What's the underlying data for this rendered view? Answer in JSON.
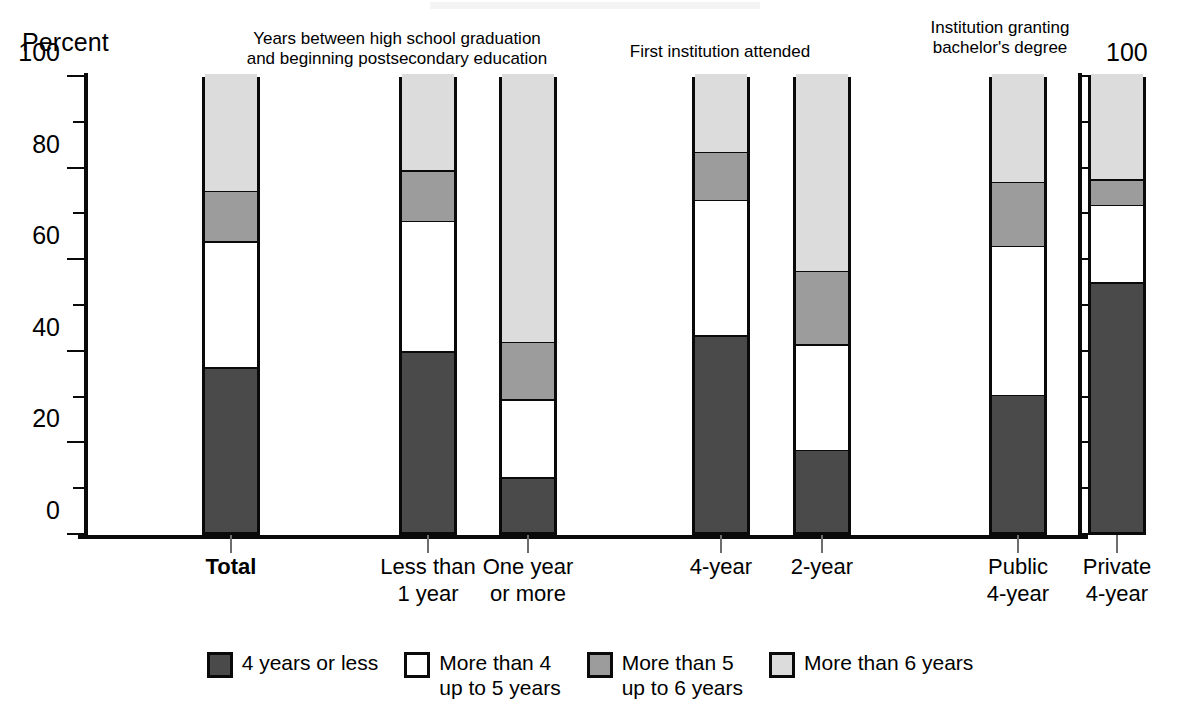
{
  "axis": {
    "title": "Percent",
    "left_ticks": [
      "0",
      "20",
      "40",
      "60",
      "80",
      "100"
    ],
    "right_ticks": [
      "0",
      "20",
      "40",
      "60",
      "80",
      "100"
    ]
  },
  "group_headers": [
    {
      "text": "Years between high school graduation\nand beginning postsecondary education"
    },
    {
      "text": "First institution attended"
    },
    {
      "text": "Institution granting\nbachelor's degree"
    }
  ],
  "categories": [
    "Total",
    "Less than\n1 year",
    "One year\nor more",
    "4-year",
    "2-year",
    "Public\n4-year",
    "Private\n4-year"
  ],
  "legend": [
    {
      "label": "4 years or less",
      "color": "#4a4a4a"
    },
    {
      "label": "More than 4\nup to 5 years",
      "color": "#ffffff"
    },
    {
      "label": "More than 5\nup to 6 years",
      "color": "#9c9c9c"
    },
    {
      "label": "More than 6 years",
      "color": "#dcdcdc"
    }
  ],
  "chart_data": {
    "type": "bar",
    "subtype": "stacked-100-percent",
    "title": "",
    "xlabel": "",
    "ylabel": "Percent",
    "ylim": [
      0,
      100
    ],
    "ytick_major_step": 20,
    "ytick_minor_step": 10,
    "grid": false,
    "legend_position": "bottom",
    "dual_y_axis": true,
    "categories": [
      "Total",
      "Less than 1 year",
      "One year or more",
      "4-year",
      "2-year",
      "Public 4-year",
      "Private 4-year"
    ],
    "series": [
      {
        "name": "4 years or less",
        "color": "#4a4a4a",
        "values": [
          36.0,
          39.5,
          12.0,
          43.0,
          18.0,
          30.0,
          54.5
        ]
      },
      {
        "name": "More than 4 up to 5 years",
        "color": "#ffffff",
        "values": [
          27.5,
          28.5,
          17.0,
          29.5,
          23.0,
          32.5,
          17.0
        ]
      },
      {
        "name": "More than 5 up to 6 years",
        "color": "#9c9c9c",
        "values": [
          11.0,
          11.0,
          12.5,
          10.5,
          16.0,
          14.0,
          5.5
        ]
      },
      {
        "name": "More than 6 years",
        "color": "#dcdcdc",
        "values": [
          25.5,
          21.0,
          58.5,
          17.0,
          43.0,
          23.5,
          23.0
        ]
      }
    ],
    "cumulative_tops": [
      [
        36.0,
        63.5,
        74.5,
        100
      ],
      [
        39.5,
        68.0,
        79.0,
        100
      ],
      [
        12.0,
        29.0,
        41.5,
        100
      ],
      [
        43.0,
        72.5,
        83.0,
        100
      ],
      [
        18.0,
        41.0,
        57.0,
        100
      ],
      [
        30.0,
        62.5,
        76.5,
        100
      ],
      [
        54.5,
        71.5,
        77.0,
        100
      ]
    ]
  },
  "layout": {
    "bars": [
      {
        "index": 0,
        "left_px": 118,
        "width_px": 58
      },
      {
        "index": 1,
        "left_px": 315,
        "width_px": 58
      },
      {
        "index": 2,
        "left_px": 415,
        "width_px": 58
      },
      {
        "index": 3,
        "left_px": 608,
        "width_px": 58
      },
      {
        "index": 4,
        "left_px": 709,
        "width_px": 58
      },
      {
        "index": 5,
        "left_px": 905,
        "width_px": 58
      },
      {
        "index": 6,
        "left_px": 1004,
        "width_px": 58
      }
    ],
    "group_header_positions": [
      {
        "left_px": 232,
        "width_px": 330,
        "top_px": 29
      },
      {
        "left_px": 575,
        "width_px": 290,
        "top_px": 42
      },
      {
        "left_px": 880,
        "width_px": 240,
        "top_px": 18
      }
    ],
    "cat_label_top_px": 553
  }
}
